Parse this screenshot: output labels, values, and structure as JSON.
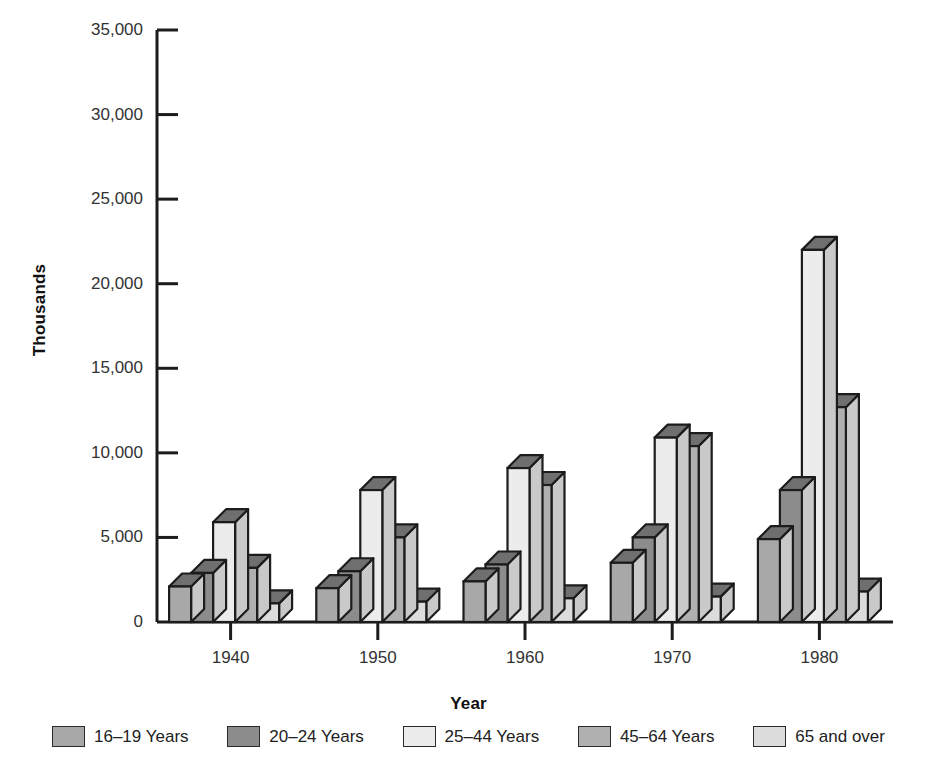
{
  "chart_data": {
    "type": "bar",
    "title": "",
    "subtitle": "",
    "xlabel": "Year",
    "ylabel": "Thousands",
    "categories": [
      "1940",
      "1950",
      "1960",
      "1970",
      "1980"
    ],
    "ylim": [
      0,
      35000
    ],
    "ytick_labels": [
      "0",
      "5,000",
      "10,000",
      "15,000",
      "20,000",
      "25,000",
      "30,000",
      "35,000"
    ],
    "ytick_values": [
      0,
      5000,
      10000,
      15000,
      20000,
      25000,
      30000,
      35000
    ],
    "grid": false,
    "legend_position": "bottom",
    "style": "3d-bar",
    "series": [
      {
        "name": "16–19 Years",
        "color": "#a8a8a8",
        "values": [
          2100,
          2000,
          2400,
          3500,
          4900
        ]
      },
      {
        "name": "20–24 Years",
        "color": "#8c8c8c",
        "values": [
          2900,
          3000,
          3400,
          5000,
          7800
        ]
      },
      {
        "name": "25–44 Years",
        "color": "#ececec",
        "values": [
          5900,
          7800,
          9100,
          10900,
          22000
        ]
      },
      {
        "name": "45–64 Years",
        "color": "#b0b0b0",
        "values": [
          3200,
          5000,
          8100,
          10400,
          12700
        ]
      },
      {
        "name": "65 and over",
        "color": "#dcdcdc",
        "values": [
          1100,
          1200,
          1400,
          1500,
          1800
        ]
      }
    ]
  },
  "axis": {
    "y_title": "Thousands",
    "x_title": "Year"
  },
  "colors": {
    "axis": "#1c1c1c",
    "background": "#ffffff",
    "bar_outline": "#1c1c1c",
    "top_face_shade": "#6f6f6f",
    "side_face_shade": "#c9c9c9"
  }
}
